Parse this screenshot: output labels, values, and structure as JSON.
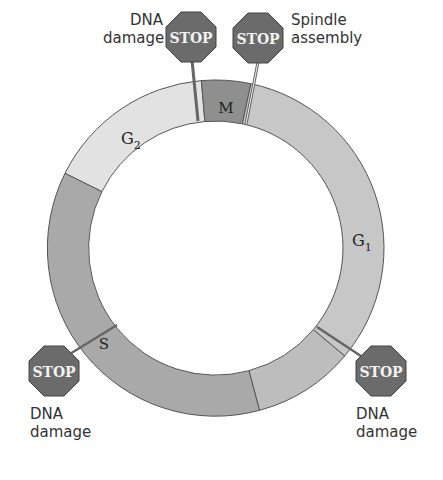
{
  "diagram": {
    "phases": [
      {
        "id": "M",
        "label": "M",
        "sub": "",
        "color": "#8f8f8f"
      },
      {
        "id": "G1",
        "label": "G",
        "sub": "1",
        "color": "#c7c7c7"
      },
      {
        "id": "S",
        "label": "S",
        "sub": "",
        "color": "#a9a9a9"
      },
      {
        "id": "G2",
        "label": "G",
        "sub": "2",
        "color": "#e2e2e2"
      }
    ],
    "checkpoints": [
      {
        "id": "g2-dna",
        "sign": "STOP",
        "caption_line1": "DNA",
        "caption_line2": "damage"
      },
      {
        "id": "m-spindle",
        "sign": "STOP",
        "caption_line1": "Spindle",
        "caption_line2": "assembly"
      },
      {
        "id": "s-dna",
        "sign": "STOP",
        "caption_line1": "DNA",
        "caption_line2": "damage"
      },
      {
        "id": "g1-dna",
        "sign": "STOP",
        "caption_line1": "DNA",
        "caption_line2": "damage"
      }
    ],
    "colors": {
      "stop_fill": "#6b6b6b",
      "stop_text": "#f2f2f2",
      "outline": "#555555"
    }
  }
}
